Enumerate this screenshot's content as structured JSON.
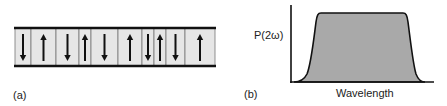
{
  "panel_a": {
    "label": "(a)",
    "description": "Periodically poled domain structure with alternating polarization",
    "domains": [
      {
        "x0": 15,
        "x1": 31,
        "direction": "down"
      },
      {
        "x0": 31,
        "x1": 56,
        "direction": "up"
      },
      {
        "x0": 56,
        "x1": 79,
        "direction": "down"
      },
      {
        "x0": 79,
        "x1": 91,
        "direction": "up"
      },
      {
        "x0": 91,
        "x1": 118,
        "direction": "down"
      },
      {
        "x0": 118,
        "x1": 142,
        "direction": "up"
      },
      {
        "x0": 142,
        "x1": 154,
        "direction": "down"
      },
      {
        "x0": 154,
        "x1": 166,
        "direction": "up"
      },
      {
        "x0": 166,
        "x1": 185,
        "direction": "down"
      },
      {
        "x0": 185,
        "x1": 215,
        "direction": "up"
      }
    ],
    "colors": {
      "fill": "#e6e6e6",
      "bar": "#111111",
      "wall": "#777777",
      "arrow": "#111111"
    }
  },
  "panel_b": {
    "label": "(b)",
    "ylabel": "P(2ω)",
    "xlabel": "Wavelength",
    "colors": {
      "fill": "#a9a9a9",
      "line": "#111111"
    }
  },
  "chart_data": {
    "type": "area",
    "title": "",
    "xlabel": "Wavelength",
    "ylabel": "P(2ω)",
    "x": [
      0,
      0.05,
      0.1,
      0.15,
      0.2,
      0.25,
      0.8,
      0.85,
      0.9,
      0.95,
      1.0
    ],
    "values": [
      0,
      0.02,
      0.2,
      0.7,
      1.0,
      1.0,
      1.0,
      1.0,
      0.7,
      0.2,
      0
    ],
    "grid": false,
    "legend": null
  }
}
